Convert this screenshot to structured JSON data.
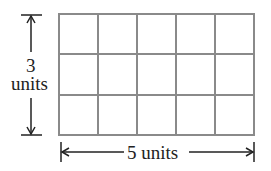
{
  "diagram": {
    "title": "",
    "grid": {
      "rows": 3,
      "cols": 5,
      "line_color": "#8a8a8a"
    },
    "height_label": {
      "value": "3",
      "unit": "units"
    },
    "width_label": {
      "text": "5 units"
    },
    "arrow_color": "#222222"
  }
}
